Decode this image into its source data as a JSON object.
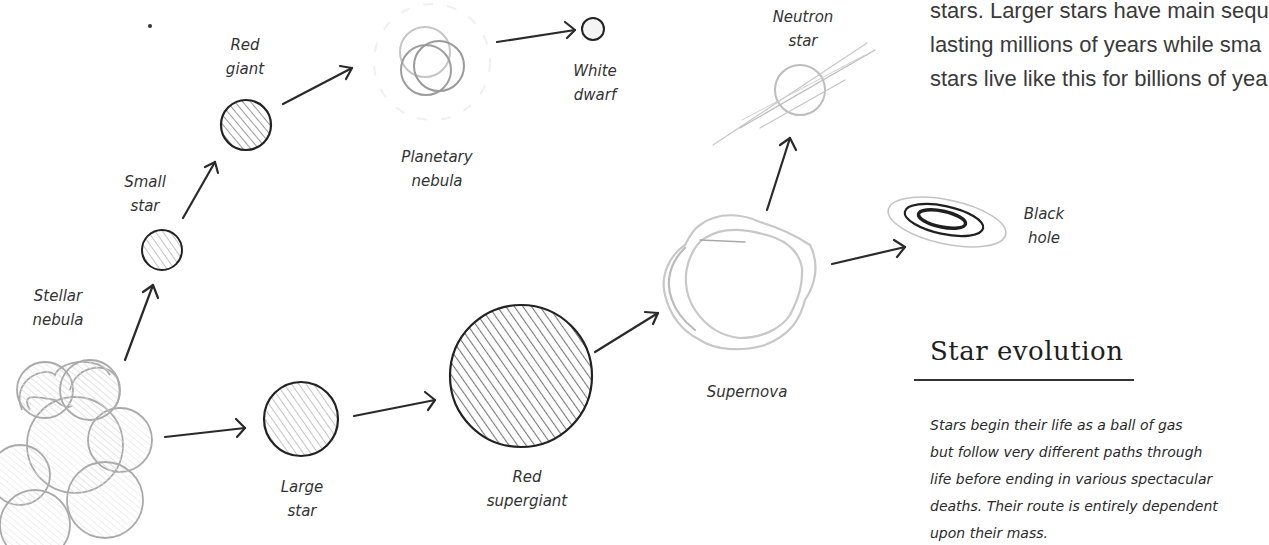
{
  "intro_text": {
    "lines": [
      "stars. Larger stars have main sequ",
      "lasting millions of years while sma",
      "stars live like this for billions of yea"
    ]
  },
  "stages": {
    "stellar_nebula": "Stellar\nnebula",
    "small_star": "Small\nstar",
    "red_giant": "Red\ngiant",
    "planetary_nebula": "Planetary\nnebula",
    "white_dwarf": "White\ndwarf",
    "large_star": "Large\nstar",
    "red_supergiant": "Red\nsupergiant",
    "supernova": "Supernova",
    "neutron_star": "Neutron\nstar",
    "black_hole": "Black\nhole"
  },
  "section": {
    "title": "Star evolution",
    "body_lines": [
      "Stars begin their life as a ball of gas",
      "but follow very different paths through",
      "life before ending in various spectacular",
      "deaths. Their route is entirely dependent",
      "upon their mass."
    ]
  },
  "colors": {
    "ink": "#2a2a2a",
    "pencil": "#9a9a9a",
    "light_pencil": "#c8c8c8"
  }
}
